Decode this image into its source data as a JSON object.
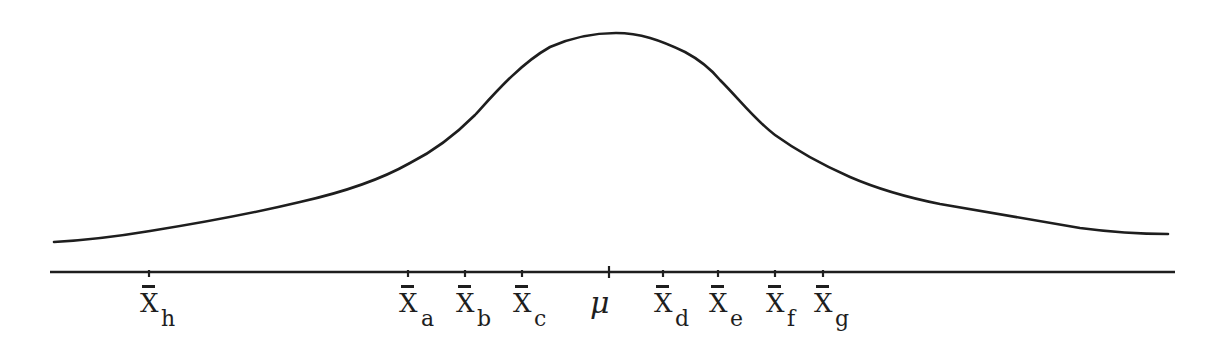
{
  "diagram": {
    "curve_type": "bell-shaped (normal) curve",
    "center_label": "μ",
    "stroke_color": "#1e1e1e",
    "background_color": "#ffffff",
    "markers": [
      {
        "id": "h",
        "base": "X",
        "sub": "h",
        "x": 149
      },
      {
        "id": "a",
        "base": "X",
        "sub": "a",
        "x": 408
      },
      {
        "id": "b",
        "base": "X",
        "sub": "b",
        "x": 465
      },
      {
        "id": "c",
        "base": "X",
        "sub": "c",
        "x": 522
      },
      {
        "id": "mu",
        "base": "μ",
        "sub": "",
        "x": 609
      },
      {
        "id": "d",
        "base": "X",
        "sub": "d",
        "x": 663
      },
      {
        "id": "e",
        "base": "X",
        "sub": "e",
        "x": 718
      },
      {
        "id": "f",
        "base": "X",
        "sub": "f",
        "x": 775
      },
      {
        "id": "g",
        "base": "X",
        "sub": "g",
        "x": 823
      }
    ]
  },
  "labels": {
    "h": {
      "base": "X",
      "sub": "h"
    },
    "a": {
      "base": "X",
      "sub": "a"
    },
    "b": {
      "base": "X",
      "sub": "b"
    },
    "c": {
      "base": "X",
      "sub": "c"
    },
    "mu": "μ",
    "d": {
      "base": "X",
      "sub": "d"
    },
    "e": {
      "base": "X",
      "sub": "e"
    },
    "f": {
      "base": "X",
      "sub": "f"
    },
    "g": {
      "base": "X",
      "sub": "g"
    }
  }
}
